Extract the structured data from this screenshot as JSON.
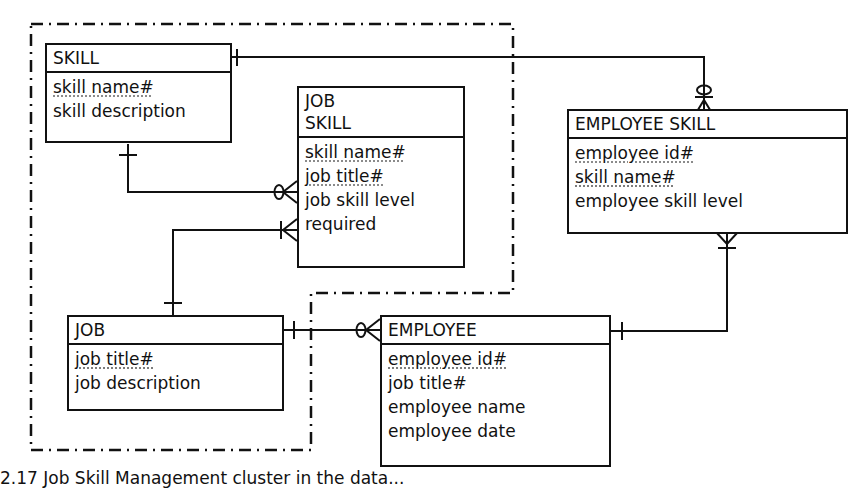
{
  "diagram": {
    "type": "entity-relationship",
    "notation": "crow's foot",
    "cluster_boundary": "dash-dot",
    "entities": [
      {
        "name": "SKILL",
        "title_lines": [
          "SKILL"
        ],
        "attributes": [
          {
            "label": "skill name#",
            "key": true
          },
          {
            "label": "skill description",
            "key": false
          }
        ]
      },
      {
        "name": "JOB SKILL",
        "title_lines": [
          "JOB",
          "SKILL"
        ],
        "attributes": [
          {
            "label": "skill name#",
            "key": true
          },
          {
            "label": "job title#",
            "key": true
          },
          {
            "label": "job skill level",
            "key": false
          },
          {
            "label": "required",
            "key": false
          }
        ]
      },
      {
        "name": "EMPLOYEE SKILL",
        "title_lines": [
          "EMPLOYEE SKILL"
        ],
        "attributes": [
          {
            "label": "employee id#",
            "key": true
          },
          {
            "label": "skill name#",
            "key": true
          },
          {
            "label": "employee skill level",
            "key": false
          }
        ]
      },
      {
        "name": "JOB",
        "title_lines": [
          "JOB"
        ],
        "attributes": [
          {
            "label": "job title#",
            "key": true
          },
          {
            "label": "job description",
            "key": false
          }
        ]
      },
      {
        "name": "EMPLOYEE",
        "title_lines": [
          "EMPLOYEE"
        ],
        "attributes": [
          {
            "label": "employee id#",
            "key": true
          },
          {
            "label": "job title#",
            "key": false
          },
          {
            "label": "employee name",
            "key": false
          },
          {
            "label": "employee date",
            "key": false
          }
        ]
      }
    ],
    "relationships": [
      {
        "from": "SKILL",
        "from_cardinality": "one",
        "to": "JOB SKILL",
        "to_cardinality": "zero-or-many"
      },
      {
        "from": "JOB",
        "from_cardinality": "one",
        "to": "JOB SKILL",
        "to_cardinality": "one-or-many"
      },
      {
        "from": "SKILL",
        "from_cardinality": "one",
        "to": "EMPLOYEE SKILL",
        "to_cardinality": "zero-or-many"
      },
      {
        "from": "JOB",
        "from_cardinality": "one",
        "to": "EMPLOYEE",
        "to_cardinality": "zero-or-many"
      },
      {
        "from": "EMPLOYEE",
        "from_cardinality": "one",
        "to": "EMPLOYEE SKILL",
        "to_cardinality": "one-or-many"
      }
    ]
  },
  "caption": "2.17   Job Skill Management cluster in the data..."
}
